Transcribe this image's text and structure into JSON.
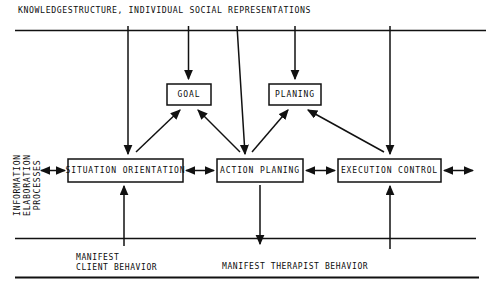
{
  "diagram": {
    "title": "KNOWLEDGESTRUCTURE, INDIVIDUAL SOCIAL REPRESENTATIONS",
    "vertical_axis_label": "INFORMATION ELABORATION\nPROCESSES",
    "boxes": {
      "goal": "GOAL",
      "planing": "PLANING",
      "situation_orientation": "SITUATION ORIENTATION",
      "action_planing": "ACTION PLANING",
      "execution_control": "EXECUTION CONTROL"
    },
    "footer": {
      "manifest_client": "MANIFEST",
      "manifest_client_2": "CLIENT BEHAVIOR",
      "manifest_therapist": "MANIFEST THERAPIST BEHAVIOR"
    },
    "colors": {
      "line": "#111111",
      "text": "#0d0d0d",
      "background": "#ffffff"
    }
  }
}
